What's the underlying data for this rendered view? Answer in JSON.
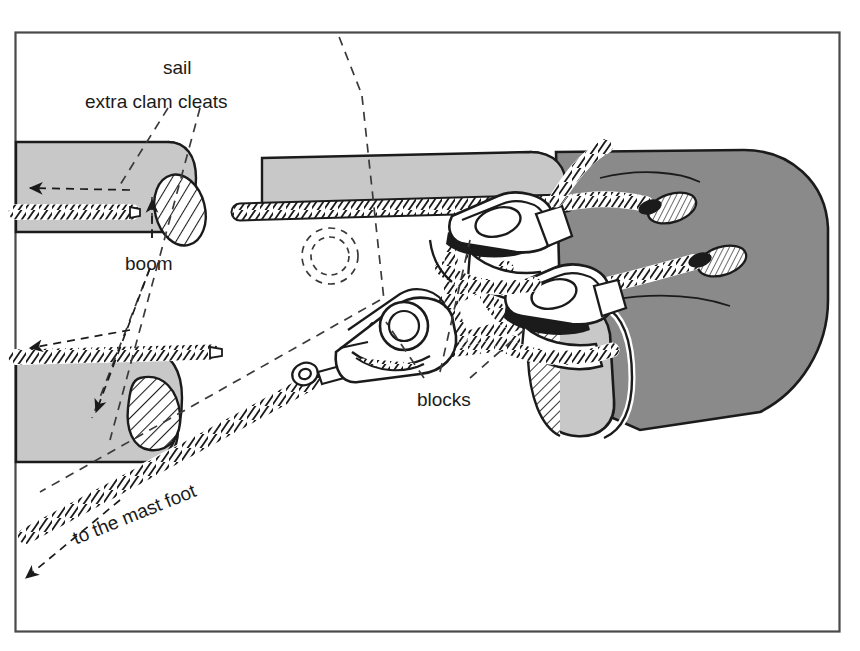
{
  "figure": {
    "kind": "technical-line-illustration",
    "frame": {
      "x": 15,
      "y": 32,
      "width": 825,
      "height": 600,
      "border_color": "#4a4a4a"
    },
    "palette": {
      "background": "#ffffff",
      "ink": "#1b1b1b",
      "sail_light": "#c8c8c8",
      "sail_dark": "#8a8a8a",
      "hatch": "#1b1b1b",
      "dashed_leader": "#3a3a3a"
    }
  },
  "labels": [
    {
      "id": "sail",
      "text": "sail",
      "x": 163,
      "y": 58,
      "rotate": 0
    },
    {
      "id": "extra-clam-cleats",
      "text": "extra clam cleats",
      "x": 85,
      "y": 92,
      "rotate": 0
    },
    {
      "id": "boom",
      "text": "boom",
      "x": 125,
      "y": 254,
      "rotate": 0
    },
    {
      "id": "blocks",
      "text": "blocks",
      "x": 417,
      "y": 390,
      "rotate": 0
    },
    {
      "id": "to-the-mast-foot",
      "text": "to the mast foot",
      "x": 70,
      "y": 530,
      "rotate": -22
    }
  ],
  "components": [
    {
      "id": "boom-upper-left",
      "type": "boom",
      "note": "light grey boom section, cut end with hatched elliptical section"
    },
    {
      "id": "boom-lower-left",
      "type": "boom",
      "note": "light grey boom section, cut end with hatched teardrop section"
    },
    {
      "id": "boom-centre",
      "type": "boom",
      "note": "light grey boom running to the right, rope along top edge"
    },
    {
      "id": "sail-panel",
      "type": "sail",
      "note": "dark grey sail panel at right with two hatched eyelets"
    },
    {
      "id": "eyelet-upper",
      "type": "eyelet",
      "note": "hatched oval cringle in sail"
    },
    {
      "id": "eyelet-lower",
      "type": "eyelet",
      "note": "hatched oval cringle in sail"
    },
    {
      "id": "block-left",
      "type": "block",
      "note": "block with shackle and becket, rope sheave"
    },
    {
      "id": "block-upper",
      "type": "block",
      "note": "upper block / clam cleat on boom top"
    },
    {
      "id": "block-right",
      "type": "block",
      "note": "right block on rope run"
    },
    {
      "id": "clam-cleat-upper-left",
      "type": "clam-cleat",
      "note": "extra clam cleat on upper-left boom"
    },
    {
      "id": "clam-cleat-lower-left",
      "type": "clam-cleat",
      "note": "extra clam cleat on lower-left boom"
    },
    {
      "id": "rope-outhaul",
      "type": "rope",
      "note": "twisted rope tail leading down-left to mast foot"
    },
    {
      "id": "hidden-hole",
      "type": "hidden-detail",
      "note": "dashed circle indicating hole through boom"
    }
  ],
  "leader_arrows": [
    {
      "id": "arrow-upper-left-cleat",
      "points_to": "clam-cleat-upper-left"
    },
    {
      "id": "arrow-lower-left-cleat",
      "points_to": "clam-cleat-lower-left"
    },
    {
      "id": "arrow-boom",
      "points_to": "boom-upper-left"
    },
    {
      "id": "arrow-boom-lower",
      "points_to": "boom-lower-left"
    },
    {
      "id": "arrow-mast-foot",
      "points_to": "rope-outhaul"
    }
  ]
}
